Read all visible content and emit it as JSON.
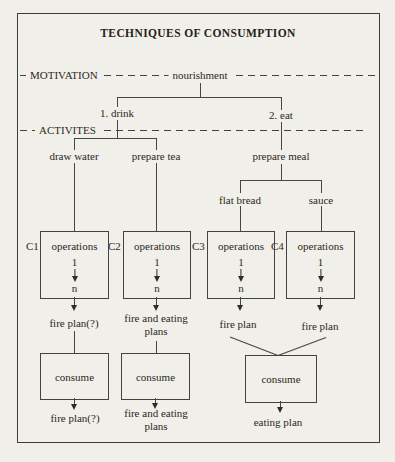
{
  "title": "TECHNIQUES OF CONSUMPTION",
  "rows": {
    "motivation": {
      "label": "MOTIVATION",
      "node": "nourishment"
    },
    "activities": {
      "label": "ACTIVITES",
      "drink": "1. drink",
      "eat": "2. eat"
    }
  },
  "tasks": {
    "draw_water": "draw water",
    "prepare_tea": "prepare tea",
    "prepare_meal": "prepare meal",
    "flat_bread": "flat bread",
    "sauce": "sauce"
  },
  "chains": [
    {
      "id": "C1",
      "op": "operations",
      "start": "1",
      "end": "n",
      "plan": "fire plan(?)",
      "consume": "consume",
      "final": "fire plan(?)"
    },
    {
      "id": "C2",
      "op": "operations",
      "start": "1",
      "end": "n",
      "plan": "fire and eating plans",
      "consume": "consume",
      "final": "fire and eating plans"
    },
    {
      "id": "C3",
      "op": "operations",
      "start": "1",
      "end": "n",
      "plan": "fire plan"
    },
    {
      "id": "C4",
      "op": "operations",
      "start": "1",
      "end": "n",
      "plan": "fire plan"
    }
  ],
  "merge": {
    "consume": "consume",
    "final": "eating plan"
  },
  "colors": {
    "paper": "#f1efe9",
    "ink": "#2b2822",
    "line": "#49463f"
  }
}
